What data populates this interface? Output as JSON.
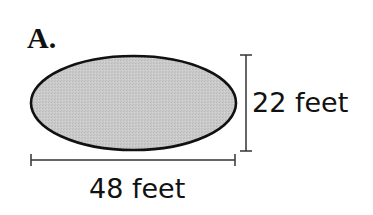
{
  "problem": {
    "label": "A.",
    "shape": "ellipse",
    "fill_color": "#c8c8c8",
    "stroke_color": "#111111",
    "dimensions": {
      "width": {
        "value": 48,
        "unit": "feet",
        "text": "48 feet"
      },
      "height": {
        "value": 22,
        "unit": "feet",
        "text": "22 feet"
      }
    }
  }
}
